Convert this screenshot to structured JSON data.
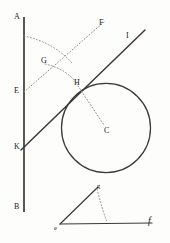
{
  "figure": {
    "caption": "Geometry construction: line AB with transversal KI tangent-secant to circle C, plus angle efg below",
    "background_color": "#fdfdfc",
    "ink_color": "#2b2b2b",
    "dotted_color": "#8a8a85",
    "canvas": {
      "width": 170,
      "height": 243
    },
    "labels": [
      {
        "id": "A",
        "text": "A",
        "x": 14,
        "y": 13,
        "style": "cap"
      },
      {
        "id": "F",
        "text": "F",
        "x": 99,
        "y": 19,
        "style": "cap"
      },
      {
        "id": "I",
        "text": "I",
        "x": 126,
        "y": 32,
        "style": "cap"
      },
      {
        "id": "G",
        "text": "G",
        "x": 41,
        "y": 57,
        "style": "cap"
      },
      {
        "id": "E",
        "text": "E",
        "x": 14,
        "y": 87,
        "style": "cap"
      },
      {
        "id": "H",
        "text": "H",
        "x": 74,
        "y": 79,
        "style": "cap"
      },
      {
        "id": "C",
        "text": "C",
        "x": 104,
        "y": 127,
        "style": "cap"
      },
      {
        "id": "K",
        "text": "K",
        "x": 14,
        "y": 143,
        "style": "cap"
      },
      {
        "id": "B",
        "text": "B",
        "x": 14,
        "y": 203,
        "style": "cap"
      },
      {
        "id": "g",
        "text": "g",
        "x": 97,
        "y": 183,
        "style": "small"
      },
      {
        "id": "e",
        "text": "e",
        "x": 54,
        "y": 225,
        "style": "small"
      },
      {
        "id": "f",
        "text": "f",
        "x": 148,
        "y": 218,
        "style": "italic"
      }
    ],
    "solid_lines": [
      {
        "name": "line-AB-vertical",
        "x1": 24,
        "y1": 17,
        "x2": 24,
        "y2": 212,
        "width": 1.6
      },
      {
        "name": "line-KI-transversal",
        "x1": 21,
        "y1": 150,
        "x2": 145,
        "y2": 30,
        "width": 1.5
      },
      {
        "name": "line-ef-base",
        "x1": 60,
        "y1": 224,
        "x2": 152,
        "y2": 223,
        "width": 1.3
      },
      {
        "name": "line-eg-slant",
        "x1": 60,
        "y1": 224,
        "x2": 98,
        "y2": 187,
        "width": 1.3
      }
    ],
    "circle": {
      "name": "circle-C",
      "cx": 106,
      "cy": 128,
      "r": 44.5,
      "width": 1.3
    },
    "dotted_lines": [
      {
        "name": "dotted-EF-ray",
        "x1": 24,
        "y1": 92,
        "x2": 104,
        "y2": 22
      },
      {
        "name": "dotted-HC-radius",
        "x1": 78,
        "y1": 86,
        "x2": 104,
        "y2": 125
      }
    ],
    "dotted_arcs": [
      {
        "name": "arc-A-to-H",
        "x1": 24,
        "y1": 36,
        "cx": 52,
        "cy": 44,
        "x2": 70,
        "y2": 61
      },
      {
        "name": "arc-G-to-H",
        "x1": 45,
        "y1": 64,
        "cx": 66,
        "cy": 70,
        "x2": 76,
        "y2": 83
      },
      {
        "name": "arc-g-to-base",
        "x1": 97,
        "y1": 189,
        "cx": 101,
        "cy": 210,
        "x2": 107,
        "y2": 222
      }
    ]
  }
}
